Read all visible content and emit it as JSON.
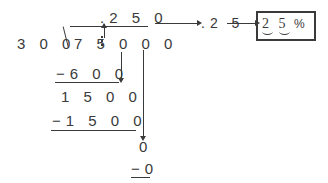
{
  "diagram": {
    "type": "long-division-worksheet",
    "colors": {
      "ink": "#3a3a3a",
      "background": "#ffffff"
    },
    "division": {
      "divisor": "3 0 0",
      "dividend": "7 5 0 0 0",
      "dividend_decimal_marker": "decimal point after 75",
      "quotient": ".2 5 0",
      "steps": [
        {
          "subtrahend": "−6 0 0",
          "remainder": "1 5 0 0"
        },
        {
          "subtrahend": "−1 5 0 0",
          "remainder": "0"
        },
        {
          "subtrahend": "−0",
          "remainder": ""
        }
      ]
    },
    "flow": {
      "step1_label": ".2 5 0",
      "arrow1": "arrow-right",
      "step2_label": ".2 5",
      "arrow2": "arrow-right",
      "answer_digits": "2 5",
      "answer_percent_symbol": "%"
    },
    "annotations": {
      "decimal_carry_arrow": "up-arrow",
      "bring_down_arrow_1": "down-arrow",
      "bring_down_arrow_2": "down-arrow"
    }
  }
}
